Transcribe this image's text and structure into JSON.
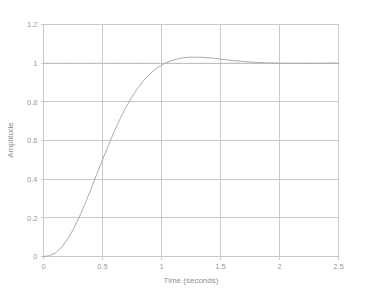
{
  "chart_data": {
    "type": "line",
    "title": "",
    "xlabel": "Time (seconds)",
    "ylabel": "Amplitude",
    "xlim": [
      0,
      2.5
    ],
    "ylim": [
      0,
      1.2
    ],
    "grid": true,
    "legend": false,
    "xticks": [
      0,
      0.5,
      1,
      1.5,
      2,
      2.5
    ],
    "xtick_labels": [
      "0",
      "0.5",
      "1",
      "1.5",
      "2",
      "2.5"
    ],
    "yticks": [
      0,
      0.2,
      0.4,
      0.6,
      0.8,
      1,
      1.2
    ],
    "ytick_labels": [
      "0",
      "0.2",
      "0.4",
      "0.6",
      "0.8",
      "1",
      "1.2"
    ],
    "annotations": {
      "peak_value": 1.05,
      "peak_time": 0.97,
      "steady_state": 1.0,
      "settling_time": 1.5
    },
    "series": [
      {
        "name": "step-response",
        "color": "#a8a8a8",
        "style": "solid",
        "x": [
          0,
          0.05,
          0.1,
          0.15,
          0.2,
          0.25,
          0.3,
          0.35,
          0.4,
          0.45,
          0.5,
          0.55,
          0.6,
          0.65,
          0.7,
          0.75,
          0.8,
          0.85,
          0.9,
          0.95,
          1.0,
          1.05,
          1.1,
          1.15,
          1.2,
          1.25,
          1.3,
          1.35,
          1.4,
          1.45,
          1.5,
          1.6,
          1.7,
          1.8,
          1.9,
          2.0,
          2.1,
          2.2,
          2.3,
          2.4,
          2.5
        ],
        "y": [
          0,
          0.004,
          0.018,
          0.046,
          0.086,
          0.138,
          0.2,
          0.27,
          0.345,
          0.423,
          0.5,
          0.575,
          0.647,
          0.713,
          0.773,
          0.826,
          0.872,
          0.911,
          0.944,
          0.97,
          0.99,
          1.005,
          1.016,
          1.024,
          1.029,
          1.031,
          1.031,
          1.03,
          1.028,
          1.025,
          1.021,
          1.014,
          1.008,
          1.004,
          1.001,
          1.0,
          0.999,
          0.999,
          0.999,
          1.0,
          1.0
        ]
      },
      {
        "name": "reference-line",
        "color": "#b0b0b0",
        "style": "dotted",
        "x": [
          0,
          2.5
        ],
        "y": [
          1.0,
          1.0
        ]
      }
    ]
  },
  "axes": {
    "x_title": "Time (seconds)",
    "y_title": "Amplitude"
  }
}
